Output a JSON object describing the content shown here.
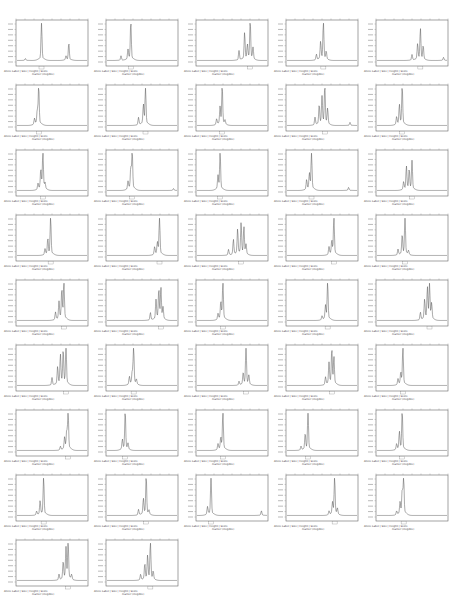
{
  "figure": {
    "layout": {
      "columns": 5,
      "rows": 9,
      "panel_count": 42
    },
    "caption_header": "Allele Label | Size | Height | Score",
    "marker_label_placeholder": "marker (illegible)"
  },
  "chart_data": {
    "type": "line",
    "title": "",
    "xlabel": "Size (bp)",
    "ylabel": "Fluorescence (RFU)",
    "grid": false,
    "legend": "none",
    "panels": [
      {
        "peaks": [
          [
            0.12,
            0.05
          ],
          [
            0.35,
            1.0
          ],
          [
            0.7,
            0.1
          ],
          [
            0.74,
            0.45
          ]
        ]
      },
      {
        "peaks": [
          [
            0.2,
            0.12
          ],
          [
            0.3,
            0.25
          ],
          [
            0.34,
            1.0
          ]
        ]
      },
      {
        "peaks": [
          [
            0.6,
            0.25
          ],
          [
            0.68,
            0.7
          ],
          [
            0.72,
            0.35
          ],
          [
            0.76,
            1.0
          ],
          [
            0.8,
            0.3
          ]
        ]
      },
      {
        "peaks": [
          [
            0.42,
            0.15
          ],
          [
            0.48,
            0.45
          ],
          [
            0.52,
            1.0
          ],
          [
            0.56,
            0.2
          ]
        ]
      },
      {
        "peaks": [
          [
            0.5,
            0.15
          ],
          [
            0.58,
            0.4
          ],
          [
            0.62,
            0.8
          ],
          [
            0.66,
            0.35
          ],
          [
            0.95,
            0.08
          ]
        ]
      },
      {
        "peaks": [
          [
            0.25,
            0.15
          ],
          [
            0.29,
            0.35
          ],
          [
            0.31,
            1.0
          ]
        ]
      },
      {
        "peaks": [
          [
            0.45,
            0.2
          ],
          [
            0.52,
            0.5
          ],
          [
            0.55,
            1.0
          ]
        ]
      },
      {
        "peaks": [
          [
            0.28,
            0.15
          ],
          [
            0.33,
            0.45
          ],
          [
            0.36,
            1.0
          ],
          [
            0.4,
            0.1
          ]
        ]
      },
      {
        "peaks": [
          [
            0.4,
            0.2
          ],
          [
            0.46,
            0.5
          ],
          [
            0.5,
            0.7
          ],
          [
            0.54,
            1.0
          ],
          [
            0.58,
            0.4
          ],
          [
            0.9,
            0.08
          ]
        ]
      },
      {
        "peaks": [
          [
            0.28,
            0.2
          ],
          [
            0.32,
            0.5
          ],
          [
            0.36,
            1.0
          ]
        ]
      },
      {
        "peaks": [
          [
            0.3,
            0.15
          ],
          [
            0.34,
            0.5
          ],
          [
            0.37,
            1.0
          ],
          [
            0.4,
            0.15
          ]
        ]
      },
      {
        "peaks": [
          [
            0.3,
            0.2
          ],
          [
            0.34,
            0.55
          ],
          [
            0.36,
            1.0
          ],
          [
            0.95,
            0.05
          ]
        ]
      },
      {
        "peaks": [
          [
            0.3,
            0.35
          ],
          [
            0.33,
            1.0
          ]
        ]
      },
      {
        "peaks": [
          [
            0.28,
            0.25
          ],
          [
            0.32,
            0.4
          ],
          [
            0.35,
            1.0
          ],
          [
            0.88,
            0.08
          ]
        ]
      },
      {
        "peaks": [
          [
            0.38,
            0.2
          ],
          [
            0.42,
            0.6
          ],
          [
            0.46,
            0.5
          ],
          [
            0.5,
            0.75
          ]
        ]
      },
      {
        "peaks": [
          [
            0.4,
            0.15
          ],
          [
            0.44,
            0.4
          ],
          [
            0.48,
            1.0
          ]
        ]
      },
      {
        "peaks": [
          [
            0.68,
            0.2
          ],
          [
            0.72,
            0.3
          ],
          [
            0.75,
            1.0
          ]
        ]
      },
      {
        "peaks": [
          [
            0.45,
            0.15
          ],
          [
            0.52,
            0.4
          ],
          [
            0.58,
            0.65
          ],
          [
            0.63,
            0.8
          ],
          [
            0.67,
            0.7
          ],
          [
            0.7,
            0.25
          ]
        ]
      },
      {
        "peaks": [
          [
            0.6,
            0.2
          ],
          [
            0.64,
            0.35
          ],
          [
            0.67,
            1.0
          ]
        ]
      },
      {
        "peaks": [
          [
            0.3,
            0.15
          ],
          [
            0.36,
            0.5
          ],
          [
            0.4,
            1.0
          ],
          [
            0.45,
            0.1
          ]
        ]
      },
      {
        "peaks": [
          [
            0.55,
            0.2
          ],
          [
            0.6,
            0.45
          ],
          [
            0.64,
            0.75
          ],
          [
            0.67,
            1.0
          ]
        ]
      },
      {
        "peaks": [
          [
            0.62,
            0.2
          ],
          [
            0.7,
            0.5
          ],
          [
            0.74,
            0.75
          ],
          [
            0.77,
            0.8
          ],
          [
            0.8,
            0.3
          ]
        ]
      },
      {
        "peaks": [
          [
            0.3,
            0.15
          ],
          [
            0.34,
            0.45
          ],
          [
            0.37,
            1.0
          ]
        ]
      },
      {
        "peaks": [
          [
            0.5,
            0.1
          ],
          [
            0.55,
            0.35
          ],
          [
            0.58,
            1.0
          ]
        ]
      },
      {
        "peaks": [
          [
            0.62,
            0.2
          ],
          [
            0.68,
            0.5
          ],
          [
            0.72,
            0.8
          ],
          [
            0.75,
            0.9
          ],
          [
            0.78,
            0.4
          ]
        ]
      },
      {
        "peaks": [
          [
            0.5,
            0.2
          ],
          [
            0.58,
            0.45
          ],
          [
            0.62,
            0.75
          ],
          [
            0.66,
            0.85
          ],
          [
            0.7,
            1.0
          ]
        ]
      },
      {
        "peaks": [
          [
            0.32,
            0.2
          ],
          [
            0.36,
            0.3
          ],
          [
            0.38,
            1.0
          ],
          [
            0.42,
            0.12
          ]
        ]
      },
      {
        "peaks": [
          [
            0.6,
            0.1
          ],
          [
            0.66,
            0.3
          ],
          [
            0.7,
            1.0
          ],
          [
            0.74,
            0.25
          ]
        ]
      },
      {
        "peaks": [
          [
            0.55,
            0.2
          ],
          [
            0.6,
            0.55
          ],
          [
            0.64,
            0.9
          ],
          [
            0.67,
            0.7
          ]
        ]
      },
      {
        "peaks": [
          [
            0.3,
            0.15
          ],
          [
            0.34,
            0.3
          ],
          [
            0.37,
            1.0
          ]
        ]
      },
      {
        "peaks": [
          [
            0.62,
            0.1
          ],
          [
            0.68,
            0.3
          ],
          [
            0.71,
            0.45
          ],
          [
            0.73,
            1.0
          ]
        ]
      },
      {
        "peaks": [
          [
            0.22,
            0.25
          ],
          [
            0.26,
            1.0
          ],
          [
            0.3,
            0.15
          ]
        ]
      },
      {
        "peaks": [
          [
            0.3,
            0.15
          ],
          [
            0.34,
            0.3
          ],
          [
            0.37,
            1.0
          ]
        ]
      },
      {
        "peaks": [
          [
            0.2,
            0.1
          ],
          [
            0.26,
            0.4
          ],
          [
            0.3,
            1.0
          ]
        ]
      },
      {
        "peaks": [
          [
            0.28,
            0.15
          ],
          [
            0.32,
            0.45
          ],
          [
            0.36,
            1.0
          ]
        ]
      },
      {
        "peaks": [
          [
            0.28,
            0.1
          ],
          [
            0.33,
            0.35
          ],
          [
            0.38,
            1.0
          ]
        ]
      },
      {
        "peaks": [
          [
            0.45,
            0.15
          ],
          [
            0.52,
            0.4
          ],
          [
            0.56,
            1.0
          ],
          [
            0.6,
            0.1
          ]
        ]
      },
      {
        "peaks": [
          [
            0.15,
            0.2
          ],
          [
            0.2,
            1.0
          ],
          [
            0.92,
            0.12
          ]
        ]
      },
      {
        "peaks": [
          [
            0.6,
            0.1
          ],
          [
            0.65,
            0.3
          ],
          [
            0.68,
            1.0
          ],
          [
            0.72,
            0.15
          ]
        ]
      },
      {
        "peaks": [
          [
            0.28,
            0.1
          ],
          [
            0.33,
            0.3
          ],
          [
            0.36,
            0.6
          ],
          [
            0.38,
            1.0
          ]
        ]
      },
      {
        "peaks": [
          [
            0.6,
            0.15
          ],
          [
            0.66,
            0.45
          ],
          [
            0.7,
            0.8
          ],
          [
            0.73,
            1.0
          ],
          [
            0.78,
            0.12
          ]
        ]
      },
      {
        "peaks": [
          [
            0.48,
            0.15
          ],
          [
            0.54,
            0.4
          ],
          [
            0.58,
            0.6
          ],
          [
            0.62,
            1.0
          ],
          [
            0.66,
            0.2
          ]
        ]
      }
    ]
  }
}
